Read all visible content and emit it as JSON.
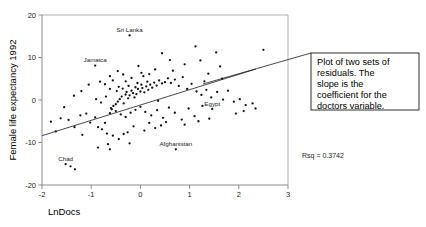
{
  "chart_data": {
    "type": "scatter",
    "title": "",
    "xlabel": "LnDocs",
    "ylabel": "Female life expectancy 1992",
    "xlim": [
      -2,
      3
    ],
    "ylim": [
      -20,
      20
    ],
    "xticks": [
      "-2",
      "-1",
      "0",
      "1",
      "2",
      "3"
    ],
    "xtick_values": [
      -2,
      -1,
      0,
      1,
      2,
      3
    ],
    "yticks": [
      "20",
      "10",
      "0",
      "-10",
      "-20"
    ],
    "ytick_values": [
      20,
      10,
      0,
      -10,
      -20
    ],
    "grid": false,
    "legend": null,
    "annotations": {
      "rsq_label": "Rsq = 0.3742",
      "callout_text": "Plot of two sets of residuals. The slope is the coefficient for the doctors variable."
    },
    "regression_line": {
      "x": [
        -2.0,
        2.35
      ],
      "y": [
        -8.4,
        7.3
      ]
    },
    "point_labels": [
      {
        "name": "Sri Lanka",
        "x": -0.22,
        "y": 15.2
      },
      {
        "name": "Jamaica",
        "x": -0.92,
        "y": 8.1
      },
      {
        "name": "Egypt",
        "x": 1.46,
        "y": -2.1
      },
      {
        "name": "Afghanistan",
        "x": 0.72,
        "y": -11.6
      },
      {
        "name": "Chad",
        "x": -1.52,
        "y": -15.1
      }
    ],
    "points": [
      [
        -0.22,
        15.2
      ],
      [
        -0.92,
        8.1
      ],
      [
        1.46,
        -2.1
      ],
      [
        0.72,
        -11.6
      ],
      [
        -1.52,
        -15.1
      ],
      [
        -1.42,
        -15.6
      ],
      [
        -1.33,
        -16.3
      ],
      [
        1.12,
        12.6
      ],
      [
        1.54,
        11.2
      ],
      [
        0.44,
        11.0
      ],
      [
        1.22,
        9.3
      ],
      [
        1.62,
        7.9
      ],
      [
        0.9,
        8.4
      ],
      [
        1.38,
        6.2
      ],
      [
        1.66,
        5.0
      ],
      [
        1.3,
        4.4
      ],
      [
        0.66,
        6.9
      ],
      [
        0.3,
        7.2
      ],
      [
        0.02,
        6.4
      ],
      [
        -0.35,
        6.0
      ],
      [
        -0.62,
        5.6
      ],
      [
        -0.82,
        4.3
      ],
      [
        -1.05,
        3.6
      ],
      [
        -1.2,
        2.1
      ],
      [
        -1.35,
        1.0
      ],
      [
        -1.55,
        -1.7
      ],
      [
        -1.72,
        -7.4
      ],
      [
        -1.82,
        -5.1
      ],
      [
        -1.62,
        -4.3
      ],
      [
        -1.46,
        -4.7
      ],
      [
        -1.22,
        -3.6
      ],
      [
        -1.1,
        -3.2
      ],
      [
        -1.02,
        -5.3
      ],
      [
        -0.92,
        -4.1
      ],
      [
        -0.86,
        -6.4
      ],
      [
        -0.78,
        -6.9
      ],
      [
        -0.72,
        -5.4
      ],
      [
        -0.68,
        -7.9
      ],
      [
        -0.62,
        -3.1
      ],
      [
        -0.58,
        -2.2
      ],
      [
        -0.55,
        -1.4
      ],
      [
        -0.5,
        -1.0
      ],
      [
        -0.46,
        -0.4
      ],
      [
        -0.42,
        0.2
      ],
      [
        -0.38,
        0.8
      ],
      [
        -0.34,
        -0.8
      ],
      [
        -0.3,
        1.3
      ],
      [
        -0.28,
        1.9
      ],
      [
        -0.25,
        0.4
      ],
      [
        -0.22,
        1.1
      ],
      [
        -0.18,
        2.2
      ],
      [
        -0.15,
        1.6
      ],
      [
        -0.12,
        0.6
      ],
      [
        -0.08,
        1.4
      ],
      [
        -0.05,
        2.6
      ],
      [
        0.0,
        2.0
      ],
      [
        0.04,
        2.8
      ],
      [
        0.08,
        1.8
      ],
      [
        0.12,
        3.2
      ],
      [
        0.16,
        2.4
      ],
      [
        0.2,
        3.6
      ],
      [
        0.24,
        2.9
      ],
      [
        0.28,
        4.1
      ],
      [
        0.33,
        3.4
      ],
      [
        0.38,
        4.6
      ],
      [
        0.44,
        3.9
      ],
      [
        0.5,
        4.2
      ],
      [
        0.56,
        5.1
      ],
      [
        0.62,
        4.0
      ],
      [
        0.7,
        4.8
      ],
      [
        0.78,
        3.3
      ],
      [
        0.86,
        5.4
      ],
      [
        0.95,
        2.6
      ],
      [
        1.04,
        3.8
      ],
      [
        1.14,
        2.0
      ],
      [
        1.24,
        1.2
      ],
      [
        1.34,
        2.4
      ],
      [
        1.44,
        0.6
      ],
      [
        1.56,
        1.9
      ],
      [
        1.68,
        0.1
      ],
      [
        1.78,
        2.2
      ],
      [
        1.9,
        -0.4
      ],
      [
        2.02,
        0.2
      ],
      [
        2.14,
        -1.2
      ],
      [
        2.34,
        -2.0
      ],
      [
        2.5,
        11.8
      ],
      [
        -0.72,
        3.7
      ],
      [
        -0.56,
        4.6
      ],
      [
        -0.44,
        3.1
      ],
      [
        -0.3,
        4.4
      ],
      [
        -0.18,
        5.2
      ],
      [
        -0.06,
        4.0
      ],
      [
        0.06,
        5.6
      ],
      [
        0.18,
        6.1
      ],
      [
        -0.62,
        2.6
      ],
      [
        -0.48,
        2.1
      ],
      [
        -0.36,
        2.7
      ],
      [
        -0.24,
        3.3
      ],
      [
        -0.1,
        3.0
      ],
      [
        0.02,
        3.6
      ],
      [
        0.14,
        4.3
      ],
      [
        -0.9,
        0.2
      ],
      [
        -0.8,
        -0.6
      ],
      [
        -0.7,
        0.8
      ],
      [
        -0.6,
        -1.9
      ],
      [
        -0.5,
        -2.6
      ],
      [
        -0.4,
        -3.4
      ],
      [
        -0.3,
        -4.0
      ],
      [
        -0.2,
        -3.0
      ],
      [
        -0.1,
        -2.3
      ],
      [
        0.0,
        -1.6
      ],
      [
        0.1,
        -2.8
      ],
      [
        0.22,
        -3.6
      ],
      [
        0.34,
        -2.4
      ],
      [
        0.46,
        -4.2
      ],
      [
        0.58,
        -1.8
      ],
      [
        0.7,
        -3.0
      ],
      [
        0.84,
        -4.6
      ],
      [
        0.98,
        -2.0
      ],
      [
        1.1,
        -3.8
      ],
      [
        1.26,
        -1.4
      ],
      [
        -0.56,
        -8.4
      ],
      [
        -0.44,
        -9.2
      ],
      [
        -0.66,
        -10.4
      ],
      [
        -0.62,
        -11.6
      ],
      [
        -0.86,
        -11.2
      ],
      [
        -0.22,
        -10.2
      ],
      [
        -0.26,
        -7.6
      ],
      [
        -0.34,
        -8.0
      ],
      [
        0.18,
        -5.4
      ],
      [
        0.3,
        -6.6
      ],
      [
        0.42,
        -6.0
      ],
      [
        0.52,
        -5.2
      ],
      [
        0.9,
        -5.8
      ],
      [
        1.18,
        -5.0
      ],
      [
        1.4,
        -4.4
      ],
      [
        0.08,
        -7.2
      ],
      [
        -0.14,
        -6.2
      ],
      [
        -1.18,
        -8.2
      ],
      [
        -1.34,
        -6.4
      ],
      [
        2.1,
        -2.6
      ],
      [
        2.28,
        -0.8
      ],
      [
        1.94,
        -3.2
      ],
      [
        0.36,
        -0.2
      ],
      [
        -0.04,
        8.0
      ],
      [
        0.6,
        9.4
      ],
      [
        -0.46,
        6.8
      ]
    ]
  },
  "callout": {
    "line1": "Plot of two sets of",
    "line2": "residuals. The",
    "line3": "slope is the",
    "line4": "coefficient for the",
    "line5": "doctors variable."
  }
}
